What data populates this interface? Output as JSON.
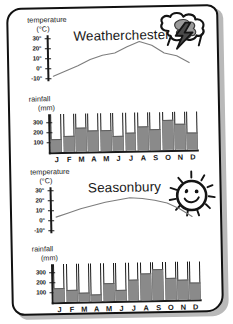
{
  "document": {
    "type": "climate-worksheet",
    "sheet_color": "#ffffff",
    "ink_color": "#111111",
    "bar_color": "#8a8a8a",
    "line_color": "#7d7d7d"
  },
  "panels": [
    {
      "title": "Weatherchester",
      "icon": "storm-cloud-lightning-icon",
      "temperature": {
        "caption": "temperature",
        "unit": "(°C)",
        "tick_labels": [
          "30°",
          "20°",
          "10°",
          "0°",
          "-10°"
        ],
        "ticks": [
          30,
          20,
          10,
          0,
          -10
        ]
      },
      "rainfall": {
        "caption": "rainfall",
        "unit": "(mm)",
        "tick_labels": [
          "300",
          "200",
          "100"
        ],
        "ticks": [
          300,
          200,
          100
        ]
      }
    },
    {
      "title": "Seasonbury",
      "icon": "smiling-sun-icon",
      "temperature": {
        "caption": "temperature",
        "unit": "(°C)",
        "tick_labels": [
          "30°",
          "20°",
          "10°",
          "0°",
          "-10°"
        ],
        "ticks": [
          30,
          20,
          10,
          0,
          -10
        ]
      },
      "rainfall": {
        "caption": "rainfall",
        "unit": "(mm)",
        "tick_labels": [
          "300",
          "200",
          "100"
        ],
        "ticks": [
          300,
          200,
          100
        ]
      }
    }
  ],
  "months": [
    "J",
    "F",
    "M",
    "A",
    "M",
    "J",
    "J",
    "A",
    "S",
    "O",
    "N",
    "D"
  ],
  "chart_data": [
    {
      "type": "line",
      "title": "Weatherchester",
      "subtitle": "temperature",
      "xlabel": "",
      "ylabel": "temperature (°C)",
      "x": [
        "J",
        "F",
        "M",
        "A",
        "M",
        "J",
        "J",
        "A",
        "S",
        "O",
        "N",
        "D"
      ],
      "values": [
        -8,
        -3,
        2,
        8,
        12,
        14,
        20,
        25,
        21,
        13,
        10,
        3
      ],
      "ylim": [
        -13,
        33
      ],
      "yticks": [
        -10,
        0,
        10,
        20,
        30
      ],
      "grid": false,
      "legend": "none",
      "series_color": "#7d7d7d"
    },
    {
      "type": "bar",
      "title": "Weatherchester",
      "subtitle": "rainfall",
      "xlabel": "",
      "ylabel": "rainfall (mm)",
      "categories": [
        "J",
        "F",
        "M",
        "A",
        "M",
        "J",
        "J",
        "A",
        "S",
        "O",
        "N",
        "D"
      ],
      "values": [
        130,
        160,
        240,
        215,
        215,
        150,
        180,
        240,
        215,
        300,
        260,
        175
      ],
      "ylim": [
        0,
        380
      ],
      "yticks": [
        100,
        200,
        300
      ],
      "grid": false,
      "legend": "none",
      "series_color": "#8a8a8a"
    },
    {
      "type": "line",
      "title": "Seasonbury",
      "subtitle": "temperature",
      "xlabel": "",
      "ylabel": "temperature (°C)",
      "x": [
        "J",
        "F",
        "M",
        "A",
        "M",
        "J",
        "J",
        "A",
        "S",
        "O",
        "N",
        "D"
      ],
      "values": [
        3,
        7,
        11,
        14,
        17,
        19,
        21,
        20,
        18,
        15,
        9,
        1
      ],
      "ylim": [
        -13,
        33
      ],
      "yticks": [
        -10,
        0,
        10,
        20,
        30
      ],
      "grid": false,
      "legend": "none",
      "series_color": "#7d7d7d"
    },
    {
      "type": "bar",
      "title": "Seasonbury",
      "subtitle": "rainfall",
      "xlabel": "",
      "ylabel": "rainfall (mm)",
      "categories": [
        "J",
        "F",
        "M",
        "A",
        "M",
        "J",
        "J",
        "A",
        "S",
        "O",
        "N",
        "D"
      ],
      "values": [
        140,
        120,
        95,
        70,
        185,
        115,
        215,
        275,
        310,
        225,
        205,
        170
      ],
      "ylim": [
        0,
        380
      ],
      "yticks": [
        100,
        200,
        300
      ],
      "grid": false,
      "legend": "none",
      "series_color": "#8a8a8a"
    }
  ]
}
